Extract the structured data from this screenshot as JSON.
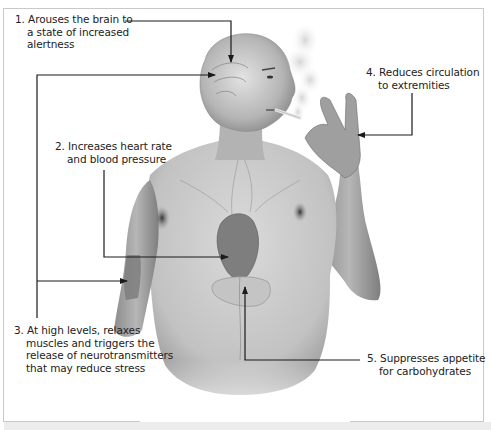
{
  "diagram": {
    "labels": [
      {
        "number": "1.",
        "lines": [
          "Arouses the brain to",
          "a state of increased",
          "alertness"
        ]
      },
      {
        "number": "2.",
        "lines": [
          "Increases heart rate",
          "and blood pressure"
        ]
      },
      {
        "number": "3.",
        "lines": [
          "At high levels, relaxes",
          "muscles and triggers the",
          "release of neurotransmitters",
          "that may reduce stress"
        ]
      },
      {
        "number": "4.",
        "lines": [
          "Reduces circulation",
          "to extremities"
        ]
      },
      {
        "number": "5.",
        "lines": [
          "Suppresses appetite",
          "for carbohydrates"
        ]
      }
    ],
    "targets": {
      "1": "brain",
      "2": "heart",
      "3": [
        "brain",
        "arm-muscle"
      ],
      "4": "hand",
      "5": "stomach"
    }
  },
  "colors": {
    "frame": "#c9c9c9",
    "arrow": "#1a1a1a",
    "text": "#222222",
    "skin_light": "#d9d9d9",
    "skin_mid": "#a8a8a8",
    "skin_dark": "#6e6e6e"
  }
}
